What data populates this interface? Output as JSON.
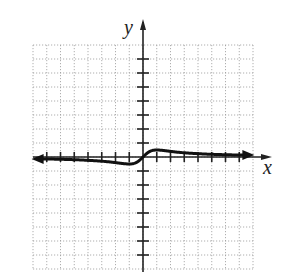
{
  "chart_data": {
    "type": "line",
    "title": "",
    "xlabel": "x",
    "ylabel": "y",
    "xlim": [
      -8,
      8
    ],
    "ylim": [
      -8,
      8
    ],
    "grid": true,
    "grid_style": "dotted",
    "tick_step": 1,
    "arrows": {
      "left_end": true,
      "right_end": true
    },
    "function": "y = x/(x^2+1)",
    "series": [
      {
        "name": "f(x)",
        "x": [
          -8,
          -7,
          -6,
          -5,
          -4,
          -3,
          -2,
          -1.5,
          -1,
          -0.5,
          0,
          0.5,
          1,
          1.5,
          2,
          3,
          4,
          5,
          6,
          7,
          8
        ],
        "values": [
          -0.12,
          -0.14,
          -0.16,
          -0.19,
          -0.24,
          -0.3,
          -0.4,
          -0.46,
          -0.5,
          -0.4,
          0,
          0.4,
          0.5,
          0.46,
          0.4,
          0.3,
          0.24,
          0.19,
          0.16,
          0.14,
          0.12
        ]
      }
    ]
  },
  "labels": {
    "x_axis": "x",
    "y_axis": "y"
  },
  "colors": {
    "axis": "#222222",
    "curve": "#111111",
    "grid": "#9a9a9a"
  }
}
